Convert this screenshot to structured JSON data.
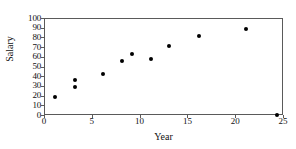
{
  "chart_data": {
    "type": "scatter",
    "title": "",
    "xlabel": "Year",
    "ylabel": "Salary",
    "xlim": [
      0,
      25
    ],
    "ylim": [
      0,
      100
    ],
    "xticks": [
      0,
      5,
      10,
      15,
      20,
      25
    ],
    "yticks": [
      0,
      10,
      20,
      30,
      40,
      50,
      60,
      70,
      80,
      90,
      100
    ],
    "grid": false,
    "legend": null,
    "marker": "filled-circle",
    "marker_color": "#000000",
    "frame_color": "#5a5a5a",
    "series": [
      {
        "name": "Salary by Year",
        "points": [
          {
            "x": 1.1,
            "y": 19
          },
          {
            "x": 3.2,
            "y": 36
          },
          {
            "x": 3.2,
            "y": 29
          },
          {
            "x": 6.2,
            "y": 42
          },
          {
            "x": 8.2,
            "y": 56
          },
          {
            "x": 9.2,
            "y": 63
          },
          {
            "x": 11.2,
            "y": 58
          },
          {
            "x": 13.1,
            "y": 71
          },
          {
            "x": 16.2,
            "y": 81
          },
          {
            "x": 21.1,
            "y": 89
          },
          {
            "x": 24.4,
            "y": 0
          }
        ]
      }
    ]
  }
}
